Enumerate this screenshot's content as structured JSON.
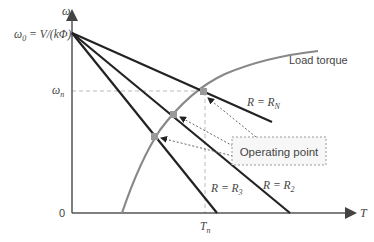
{
  "diagram": {
    "axes": {
      "y_label": "ω",
      "x_label": "T",
      "origin_label": "0",
      "omega0_label": "ω₀ = V/(kΦ)",
      "omega0_main": "ω",
      "omega0_sub": "0",
      "omega0_rest": " = V/(kΦ)",
      "omegan_main": "ω",
      "omegan_sub": "n",
      "tn_main": "T",
      "tn_sub": "n"
    },
    "curves": {
      "load_torque_label": "Load torque",
      "lines": [
        {
          "id": "RN",
          "label_main": "R = R",
          "label_sub": "N"
        },
        {
          "id": "R2",
          "label_main": "R = R",
          "label_sub": "2"
        },
        {
          "id": "R3",
          "label_main": "R = R",
          "label_sub": "3"
        }
      ]
    },
    "callout": {
      "label": "Operating point"
    },
    "colors": {
      "line": "#222222",
      "load_curve": "#888888",
      "axis": "#555555",
      "dashed": "#aaaaaa",
      "point": "#999999"
    }
  }
}
